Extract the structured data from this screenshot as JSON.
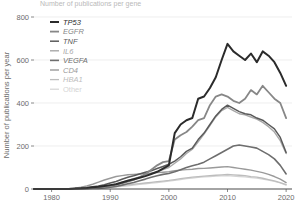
{
  "chart_data": {
    "type": "line",
    "title": "Number of publications per gene",
    "xlabel": "",
    "ylabel": "Number of publications per year",
    "xlim": [
      1977,
      2021
    ],
    "ylim": [
      0,
      800
    ],
    "xticks": [
      1980,
      1990,
      2000,
      2010,
      2020
    ],
    "yticks": [
      0,
      200,
      400,
      600,
      800
    ],
    "grid": true,
    "legend_position": "top-left",
    "x": [
      1977,
      1978,
      1979,
      1980,
      1981,
      1982,
      1983,
      1984,
      1985,
      1986,
      1987,
      1988,
      1989,
      1990,
      1991,
      1992,
      1993,
      1994,
      1995,
      1996,
      1997,
      1998,
      1999,
      2000,
      2001,
      2002,
      2003,
      2004,
      2005,
      2006,
      2007,
      2008,
      2009,
      2010,
      2011,
      2012,
      2013,
      2014,
      2015,
      2016,
      2017,
      2018,
      2019,
      2020
    ],
    "series": [
      {
        "name": "TP53",
        "color": "#2b2b2b",
        "width": 2.0,
        "values": [
          0,
          0,
          0,
          0,
          0,
          0,
          0,
          2,
          3,
          5,
          8,
          10,
          14,
          18,
          22,
          30,
          38,
          45,
          52,
          60,
          70,
          80,
          95,
          110,
          260,
          300,
          320,
          330,
          420,
          430,
          470,
          520,
          600,
          675,
          640,
          620,
          600,
          630,
          590,
          640,
          620,
          590,
          540,
          480
        ]
      },
      {
        "name": "EGFR",
        "color": "#878787",
        "width": 1.8,
        "values": [
          0,
          0,
          0,
          0,
          0,
          0,
          0,
          1,
          2,
          3,
          5,
          7,
          10,
          14,
          20,
          26,
          34,
          42,
          55,
          70,
          90,
          110,
          125,
          130,
          230,
          250,
          265,
          290,
          320,
          330,
          390,
          430,
          440,
          430,
          410,
          400,
          420,
          460,
          440,
          480,
          450,
          420,
          400,
          330
        ]
      },
      {
        "name": "TNF",
        "color": "#5a5a5a",
        "width": 1.5,
        "values": [
          0,
          0,
          0,
          0,
          0,
          0,
          1,
          2,
          4,
          6,
          10,
          14,
          20,
          28,
          35,
          45,
          55,
          62,
          70,
          78,
          85,
          95,
          105,
          115,
          130,
          150,
          175,
          190,
          230,
          260,
          300,
          340,
          370,
          390,
          375,
          360,
          350,
          345,
          330,
          320,
          300,
          280,
          240,
          170
        ]
      },
      {
        "name": "IL6",
        "color": "#a8a8a8",
        "width": 1.4,
        "values": [
          0,
          0,
          0,
          0,
          0,
          0,
          0,
          1,
          2,
          3,
          5,
          8,
          12,
          18,
          24,
          32,
          40,
          48,
          56,
          65,
          72,
          80,
          90,
          100,
          120,
          140,
          165,
          185,
          220,
          255,
          295,
          335,
          365,
          380,
          365,
          350,
          345,
          335,
          325,
          310,
          290,
          265,
          225,
          165
        ]
      },
      {
        "name": "VEGFA",
        "color": "#6e6e6e",
        "width": 1.6,
        "values": [
          0,
          0,
          0,
          0,
          0,
          0,
          0,
          0,
          1,
          1,
          2,
          3,
          5,
          8,
          12,
          18,
          24,
          30,
          38,
          46,
          55,
          62,
          68,
          72,
          80,
          90,
          100,
          108,
          115,
          125,
          140,
          155,
          170,
          185,
          200,
          205,
          200,
          195,
          190,
          175,
          160,
          140,
          110,
          70
        ]
      },
      {
        "name": "CD4",
        "color": "#9a9a9a",
        "width": 1.4,
        "values": [
          0,
          0,
          0,
          0,
          0,
          1,
          2,
          4,
          8,
          14,
          22,
          32,
          42,
          50,
          58,
          62,
          66,
          68,
          70,
          72,
          74,
          76,
          78,
          80,
          85,
          88,
          90,
          92,
          95,
          96,
          98,
          100,
          102,
          104,
          100,
          96,
          92,
          88,
          82,
          76,
          68,
          58,
          46,
          30
        ]
      },
      {
        "name": "HBA1",
        "color": "#bdbdbd",
        "width": 1.3,
        "values": [
          0,
          0,
          0,
          0,
          0,
          0,
          0,
          1,
          2,
          3,
          4,
          6,
          8,
          10,
          13,
          16,
          19,
          22,
          25,
          28,
          31,
          34,
          37,
          40,
          44,
          48,
          52,
          55,
          58,
          60,
          62,
          64,
          66,
          68,
          66,
          64,
          62,
          58,
          55,
          50,
          44,
          38,
          30,
          20
        ]
      },
      {
        "name": "Other",
        "color": "#d4d4d4",
        "width": 1.2,
        "values": [
          0,
          0,
          0,
          0,
          0,
          0,
          0,
          1,
          1,
          2,
          3,
          4,
          6,
          8,
          10,
          12,
          15,
          18,
          21,
          24,
          27,
          30,
          33,
          36,
          40,
          44,
          48,
          51,
          54,
          56,
          58,
          60,
          61,
          62,
          60,
          58,
          56,
          53,
          50,
          46,
          41,
          35,
          28,
          18
        ]
      }
    ],
    "legend": [
      {
        "label": "TP53",
        "color": "#2b2b2b",
        "width": 2.0,
        "italic": true
      },
      {
        "label": "EGFR",
        "color": "#878787",
        "width": 1.8,
        "italic": true
      },
      {
        "label": "TNF",
        "color": "#5a5a5a",
        "width": 1.5,
        "italic": true
      },
      {
        "label": "IL6",
        "color": "#a8a8a8",
        "width": 1.4,
        "italic": true
      },
      {
        "label": "VEGFA",
        "color": "#6e6e6e",
        "width": 1.6,
        "italic": true
      },
      {
        "label": "CD4",
        "color": "#9a9a9a",
        "width": 1.4,
        "italic": true
      },
      {
        "label": "HBA1",
        "color": "#bdbdbd",
        "width": 1.3,
        "italic": true
      },
      {
        "label": "Other",
        "color": "#d4d4d4",
        "width": 1.2,
        "italic": false
      }
    ]
  }
}
